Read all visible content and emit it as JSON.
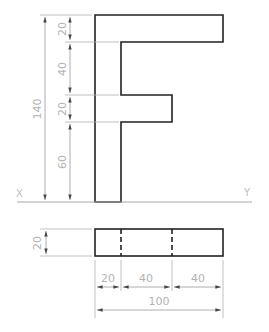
{
  "drawing": {
    "title": "Orthographic projection of letter F",
    "front_view": {
      "dims_vertical": [
        {
          "label": "20"
        },
        {
          "label": "40"
        },
        {
          "label": "20"
        },
        {
          "label": "60"
        }
      ],
      "overall_height": "140"
    },
    "reference_line": {
      "left_label": "X",
      "right_label": "Y"
    },
    "top_view": {
      "thickness": "20",
      "dims_horizontal": [
        {
          "label": "20"
        },
        {
          "label": "40"
        },
        {
          "label": "40"
        }
      ],
      "overall_width": "100"
    },
    "colors": {
      "object_line": "#222222",
      "dimension_line": "#9a9a9a",
      "dimension_text": "#b3b3b3"
    }
  }
}
